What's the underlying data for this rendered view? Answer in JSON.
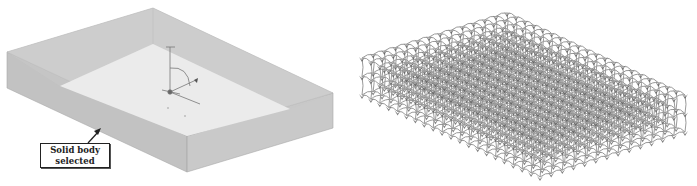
{
  "figure": {
    "left_panel": {
      "description": "Translucent solid body (rectangular block) in isometric view with coordinate triad",
      "annotation": {
        "line1": "Solid body",
        "line2": "selected"
      },
      "colors": {
        "side_face": "#c4c4c4",
        "side_face_dark": "#b8b8b8",
        "top_inner": "#e9e9e9",
        "top_rim": "#d2d2d2",
        "edge": "#a9a9a9"
      }
    },
    "right_panel": {
      "description": "Lattice structure (gyroid-like unit cells) filling the same rectangular block",
      "grid": {
        "cols_along_long_edge": 20,
        "cols_along_short_edge": 13,
        "layers": 3
      },
      "colors": {
        "strut": "#9a9a9a",
        "node": "#555555"
      }
    }
  }
}
